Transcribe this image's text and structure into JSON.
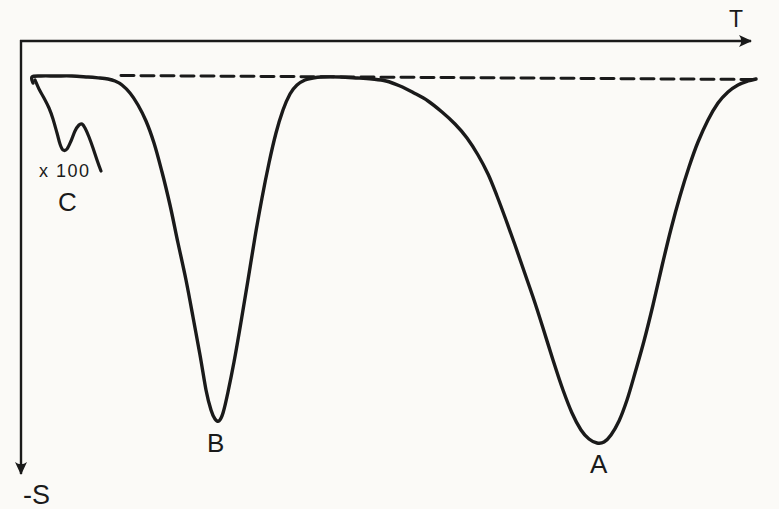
{
  "figure": {
    "paper_color": "#fbfaf7",
    "ink_color": "#1a1a1a"
  },
  "chart_data": {
    "type": "line",
    "title": "",
    "xlabel": "T",
    "ylabel": "-S",
    "grid": false,
    "axis_numeric_labels": false,
    "legend": "none",
    "axes_style": {
      "x_axis": "horizontal line along top with right-pointing arrow, label T",
      "y_axis": "vertical line along left with down-pointing arrow, label -S (signal plotted downward)"
    },
    "baseline": {
      "style": "dashed",
      "meaning": "zero-signal level"
    },
    "peaks": [
      {
        "label": "A",
        "minimum_px": [
          600,
          443
        ],
        "width": "broad"
      },
      {
        "label": "B",
        "minimum_px": [
          217,
          421
        ],
        "width": "narrow"
      },
      {
        "label": "C",
        "minimum_px": [
          63,
          150
        ],
        "note": "shown magnified x 100, double dip"
      }
    ],
    "curves": [
      {
        "name": "baseline-dashed",
        "style": "dashed",
        "dash_px": "13 7",
        "stroke_width": 3,
        "points_px": [
          [
            121,
            75.5
          ],
          [
            755,
            79.5
          ]
        ]
      },
      {
        "name": "main-trace-peaks-B-A",
        "style": "solid",
        "stroke_width": 3.4,
        "points_px": [
          [
            33,
            83
          ],
          [
            32,
            77
          ],
          [
            41,
            76
          ],
          [
            56,
            76
          ],
          [
            72,
            76
          ],
          [
            88,
            77
          ],
          [
            100,
            78
          ],
          [
            108,
            79
          ],
          [
            115,
            81
          ],
          [
            122,
            85
          ],
          [
            130,
            93
          ],
          [
            138,
            105
          ],
          [
            146,
            121
          ],
          [
            154,
            143
          ],
          [
            162,
            172
          ],
          [
            170,
            205
          ],
          [
            178,
            243
          ],
          [
            186,
            280
          ],
          [
            193,
            317
          ],
          [
            200,
            355
          ],
          [
            206,
            390
          ],
          [
            211,
            410
          ],
          [
            215,
            419
          ],
          [
            219,
            421
          ],
          [
            223,
            413
          ],
          [
            228,
            392
          ],
          [
            234,
            362
          ],
          [
            241,
            322
          ],
          [
            248,
            280
          ],
          [
            255,
            237
          ],
          [
            262,
            198
          ],
          [
            269,
            163
          ],
          [
            276,
            133
          ],
          [
            283,
            110
          ],
          [
            290,
            94
          ],
          [
            297,
            85
          ],
          [
            305,
            80
          ],
          [
            313,
            78
          ],
          [
            322,
            77
          ],
          [
            340,
            77
          ],
          [
            358,
            78
          ],
          [
            372,
            79
          ],
          [
            386,
            81
          ],
          [
            400,
            86
          ],
          [
            414,
            93
          ],
          [
            428,
            101
          ],
          [
            442,
            112
          ],
          [
            455,
            124
          ],
          [
            467,
            138
          ],
          [
            478,
            155
          ],
          [
            488,
            174
          ],
          [
            497,
            196
          ],
          [
            506,
            220
          ],
          [
            515,
            245
          ],
          [
            524,
            271
          ],
          [
            533,
            297
          ],
          [
            543,
            328
          ],
          [
            553,
            360
          ],
          [
            563,
            390
          ],
          [
            572,
            413
          ],
          [
            581,
            430
          ],
          [
            589,
            439
          ],
          [
            597,
            443
          ],
          [
            604,
            442
          ],
          [
            611,
            435
          ],
          [
            619,
            421
          ],
          [
            627,
            400
          ],
          [
            635,
            373
          ],
          [
            644,
            341
          ],
          [
            653,
            305
          ],
          [
            662,
            266
          ],
          [
            671,
            229
          ],
          [
            680,
            196
          ],
          [
            689,
            167
          ],
          [
            698,
            142
          ],
          [
            708,
            120
          ],
          [
            718,
            103
          ],
          [
            728,
            92
          ],
          [
            738,
            85
          ],
          [
            748,
            81
          ],
          [
            756,
            79
          ]
        ]
      },
      {
        "name": "trace-peak-C-magnified",
        "style": "solid",
        "stroke_width": 3.2,
        "points_px": [
          [
            35,
            80
          ],
          [
            39,
            89
          ],
          [
            44,
            98
          ],
          [
            49,
            108
          ],
          [
            53,
            119
          ],
          [
            57,
            133
          ],
          [
            60,
            144
          ],
          [
            63,
            150
          ],
          [
            67,
            149
          ],
          [
            71,
            141
          ],
          [
            75,
            131
          ],
          [
            79,
            125
          ],
          [
            82,
            124
          ],
          [
            85,
            128
          ],
          [
            89,
            137
          ],
          [
            93,
            148
          ],
          [
            97,
            160
          ],
          [
            101,
            171
          ]
        ]
      }
    ],
    "labels": [
      {
        "id": "x-axis",
        "text": "T",
        "x": 729,
        "y": 27
      },
      {
        "id": "y-axis",
        "text": "-S",
        "x": 23,
        "y": 504
      },
      {
        "id": "scale-note",
        "text": "x 100",
        "x": 39,
        "y": 177
      },
      {
        "id": "peak-c",
        "text": "C",
        "x": 58,
        "y": 211
      },
      {
        "id": "peak-b",
        "text": "B",
        "x": 207,
        "y": 452
      },
      {
        "id": "peak-a",
        "text": "A",
        "x": 590,
        "y": 473
      }
    ]
  }
}
